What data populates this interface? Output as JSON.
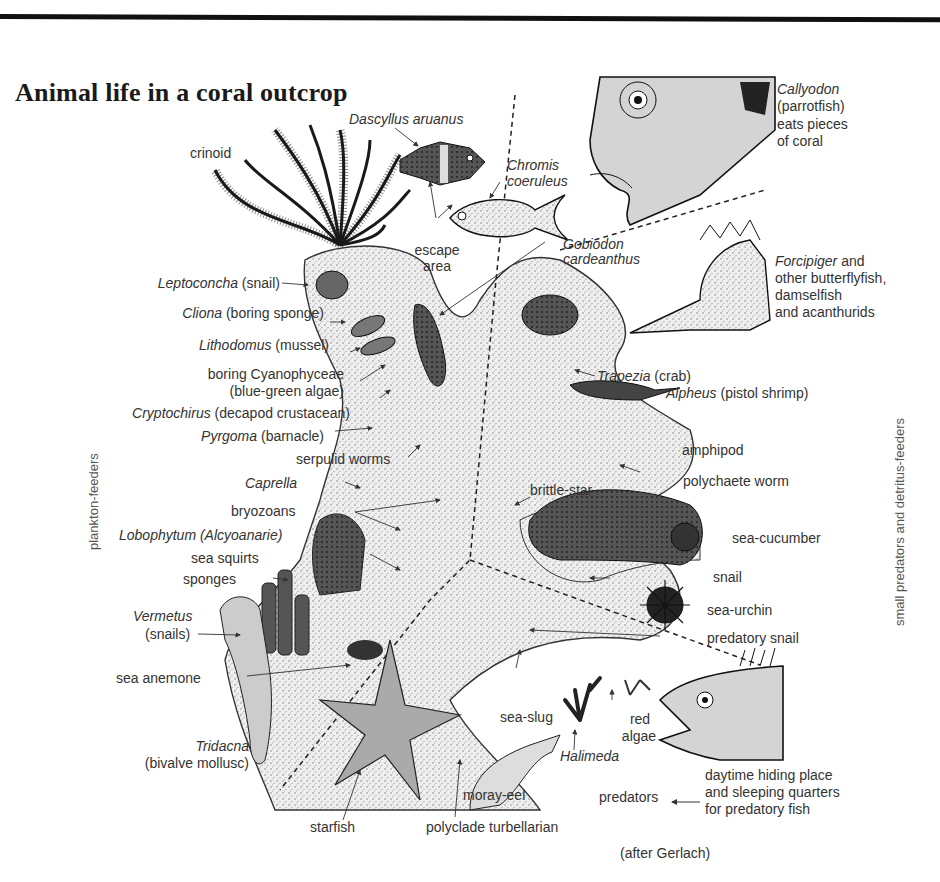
{
  "title": "Animal life in a coral outcrop",
  "side_labels": {
    "left": "plankton-feeders",
    "right": "small predators and detritus-feeders"
  },
  "credit": "(after Gerlach)",
  "labels": {
    "dascyllus": {
      "italic": "Dascyllus aruanus",
      "plain": ""
    },
    "crinoid": {
      "italic": "",
      "plain": "crinoid"
    },
    "chromis_1": {
      "italic": "Chromis",
      "plain": ""
    },
    "chromis_2": {
      "italic": "coeruleus",
      "plain": ""
    },
    "escape_1": {
      "italic": "",
      "plain": "escape"
    },
    "escape_2": {
      "italic": "",
      "plain": "area"
    },
    "gobiodon_1": {
      "italic": "Gobiodon",
      "plain": ""
    },
    "gobiodon_2": {
      "italic": "cardeanthus",
      "plain": ""
    },
    "callyodon_1": {
      "italic": "Callyodon",
      "plain": ""
    },
    "callyodon_2": {
      "italic": "",
      "plain": "(parrotfish)"
    },
    "callyodon_3": {
      "italic": "",
      "plain": "eats pieces"
    },
    "callyodon_4": {
      "italic": "",
      "plain": "of coral"
    },
    "forcipiger_1": {
      "italic": "Forcipiger",
      "plain": " and"
    },
    "forcipiger_2": {
      "italic": "",
      "plain": "other butterflyfish,"
    },
    "forcipiger_3": {
      "italic": "",
      "plain": "damselfish"
    },
    "forcipiger_4": {
      "italic": "",
      "plain": "and acanthurids"
    },
    "leptoconcha": {
      "italic": "Leptoconcha",
      "plain": " (snail)"
    },
    "cliona": {
      "italic": "Cliona",
      "plain": " (boring sponge)"
    },
    "lithodomus": {
      "italic": "Lithodomus",
      "plain": " (mussel)"
    },
    "cyano_1": {
      "italic": "",
      "plain": "boring Cyanophyceae"
    },
    "cyano_2": {
      "italic": "",
      "plain": "(blue-green algae)"
    },
    "cryptochirus": {
      "italic": "Cryptochirus",
      "plain": " (decapod crustacean)"
    },
    "pyrgoma": {
      "italic": "Pyrgoma",
      "plain": " (barnacle)"
    },
    "serpulid": {
      "italic": "",
      "plain": "serpulid worms"
    },
    "trapezia": {
      "italic": "Trapezia",
      "plain": " (crab)"
    },
    "alpheus": {
      "italic": "Alpheus",
      "plain": " (pistol shrimp)"
    },
    "amphipod": {
      "italic": "",
      "plain": "amphipod"
    },
    "polychaete": {
      "italic": "",
      "plain": "polychaete worm"
    },
    "brittlestar": {
      "italic": "",
      "plain": "brittle-star"
    },
    "caprella": {
      "italic": "Caprella",
      "plain": ""
    },
    "bryozoans": {
      "italic": "",
      "plain": "bryozoans"
    },
    "lobophytum": {
      "italic": "Lobophytum (Alcyoanarie)",
      "plain": ""
    },
    "sea_squirts": {
      "italic": "",
      "plain": "sea squirts"
    },
    "sponges": {
      "italic": "",
      "plain": "sponges"
    },
    "vermetus_1": {
      "italic": "Vermetus",
      "plain": ""
    },
    "vermetus_2": {
      "italic": "",
      "plain": "(snails)"
    },
    "sea_anemone": {
      "italic": "",
      "plain": "sea anemone"
    },
    "sea_cucumber": {
      "italic": "",
      "plain": "sea-cucumber"
    },
    "snail": {
      "italic": "",
      "plain": "snail"
    },
    "sea_urchin": {
      "italic": "",
      "plain": "sea-urchin"
    },
    "predatory_snail": {
      "italic": "",
      "plain": "predatory snail"
    },
    "tridacna_1": {
      "italic": "Tridacna",
      "plain": ""
    },
    "tridacna_2": {
      "italic": "",
      "plain": "(bivalve mollusc)"
    },
    "sea_slug": {
      "italic": "",
      "plain": "sea-slug"
    },
    "red_algae_1": {
      "italic": "",
      "plain": "red"
    },
    "red_algae_2": {
      "italic": "",
      "plain": "algae"
    },
    "halimeda": {
      "italic": "Halimeda",
      "plain": ""
    },
    "moray": {
      "italic": "",
      "plain": "moray-eel"
    },
    "predators": {
      "italic": "",
      "plain": "predators"
    },
    "daytime_1": {
      "italic": "",
      "plain": "daytime hiding place"
    },
    "daytime_2": {
      "italic": "",
      "plain": "and sleeping quarters"
    },
    "daytime_3": {
      "italic": "",
      "plain": "for predatory fish"
    },
    "starfish": {
      "italic": "",
      "plain": "starfish"
    },
    "polyclade": {
      "italic": "",
      "plain": "polyclade turbellarian"
    }
  }
}
